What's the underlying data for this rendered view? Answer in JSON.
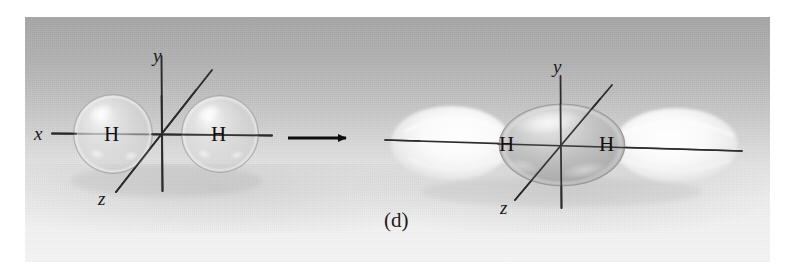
{
  "figure": {
    "caption": "(d)",
    "background": {
      "panel_top_color": "#a6a6a6",
      "panel_bottom_color": "#f5f5f5",
      "page_color": "#ffffff"
    },
    "transition_arrow": {
      "name": "reaction-arrow",
      "direction": "right"
    },
    "left_diagram": {
      "title": "two separate hydrogen 1s atomic orbitals",
      "atoms": [
        {
          "label": "H",
          "x": 113,
          "y": 134
        },
        {
          "label": "H",
          "x": 220,
          "y": 134
        }
      ],
      "axes": [
        {
          "label": "x",
          "orientation": "horizontal"
        },
        {
          "label": "y",
          "orientation": "vertical"
        },
        {
          "label": "z",
          "orientation": "diagonal"
        }
      ],
      "origin": {
        "x": 162,
        "y": 134
      },
      "orbital_shape": "sphere",
      "orbital_color": "#c9c9c9"
    },
    "right_diagram": {
      "title": "sigma antibonding molecular orbital",
      "atoms": [
        {
          "label": "H",
          "x": 508,
          "y": 145
        },
        {
          "label": "H",
          "x": 608,
          "y": 145
        }
      ],
      "axes": [
        {
          "label": "x",
          "orientation": "horizontal"
        },
        {
          "label": "y",
          "orientation": "vertical"
        },
        {
          "label": "z",
          "orientation": "diagonal"
        }
      ],
      "origin": {
        "x": 561,
        "y": 145
      },
      "orbital_shape": "ellipsoid-with-outer-lobes",
      "core_color": "#b0b0b0",
      "lobe_color": "#fbfbfb"
    }
  }
}
